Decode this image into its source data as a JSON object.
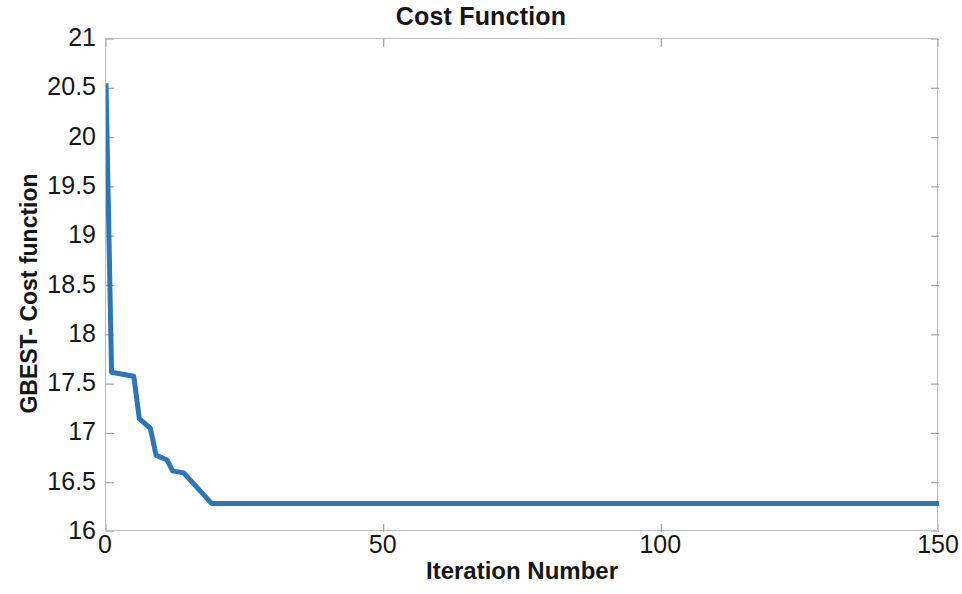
{
  "chart_data": {
    "type": "line",
    "title": "Cost Function",
    "xlabel": "Iteration Number",
    "ylabel": "GBEST- Cost function",
    "xlim": [
      0,
      150
    ],
    "ylim": [
      16,
      21
    ],
    "xticks": [
      0,
      50,
      100,
      150
    ],
    "yticks": [
      16,
      16.5,
      17,
      17.5,
      18,
      18.5,
      19,
      19.5,
      20,
      20.5,
      21
    ],
    "xtick_labels": [
      "0",
      "50",
      "100",
      "150"
    ],
    "ytick_labels": [
      "16",
      "16.5",
      "17",
      "17.5",
      "18",
      "18.5",
      "19",
      "19.5",
      "20",
      "20.5",
      "21"
    ],
    "grid": false,
    "legend": null,
    "line_color": "#2E75B6",
    "line_width": 5,
    "series": [
      {
        "name": "GBEST- Cost function",
        "x": [
          0,
          1,
          1,
          5,
          5,
          6,
          6,
          8,
          8,
          9,
          9,
          11,
          11,
          12,
          12,
          14,
          14,
          19,
          19,
          150
        ],
        "values": [
          20.55,
          17.62,
          17.62,
          17.58,
          17.58,
          17.15,
          17.15,
          17.05,
          17.05,
          16.78,
          16.78,
          16.73,
          16.73,
          16.62,
          16.62,
          16.6,
          16.6,
          16.29,
          16.29,
          16.29
        ]
      }
    ]
  },
  "axes": {
    "title": "Cost Function",
    "x_title": "Iteration Number",
    "y_title": "GBEST- Cost function"
  }
}
